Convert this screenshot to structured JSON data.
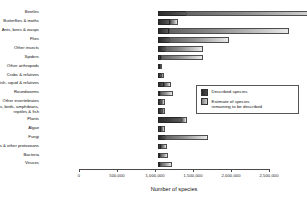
{
  "chart_data": {
    "type": "bar",
    "orientation": "horizontal",
    "stacked": true,
    "title": "",
    "xlabel": "Number of species",
    "ylabel": "",
    "xlim": [
      0,
      2500000
    ],
    "xticks": [
      0,
      500000,
      1000000,
      1500000,
      2000000,
      2500000
    ],
    "xtick_labels": [
      "0",
      "500,000",
      "1,000,000",
      "1,500,000",
      "2,000,000",
      "2,500,000"
    ],
    "grid": false,
    "legend_position": "center-right",
    "categories": [
      "Beetles",
      "Butterflies & moths",
      "Ants, bees & wasps",
      "Flies",
      "Other insects",
      "Spiders",
      "Other arthropods",
      "Crabs & relatives",
      "Shellfish, squid & relatives",
      "Roundworms",
      "Other invertebrates",
      "Mammals, birds, amphibians,\nreptiles & fish",
      "Plants",
      "Algae",
      "Fungi",
      "Amoebas & other protozoans",
      "Bacteria",
      "Viruses"
    ],
    "series": [
      {
        "name": "Described species",
        "color": "#333333",
        "values": [
          380000,
          160000,
          150000,
          155000,
          100000,
          45000,
          25000,
          47000,
          85000,
          25000,
          50000,
          65000,
          310000,
          45000,
          100000,
          40000,
          10000,
          5000
        ]
      },
      {
        "name": "Estimate of species remaining to be described",
        "color": "#b0b0b0",
        "values": [
          1920000,
          115000,
          1585000,
          790000,
          500000,
          550000,
          15000,
          38000,
          90000,
          180000,
          50000,
          30000,
          75000,
          55000,
          570000,
          80000,
          110000,
          165000
        ]
      }
    ],
    "totals": [
      2300000,
      275000,
      1735000,
      945000,
      600000,
      595000,
      40000,
      85000,
      175000,
      205000,
      100000,
      95000,
      385000,
      100000,
      670000,
      120000,
      120000,
      170000
    ]
  },
  "legend": {
    "items": [
      {
        "label": "Described species",
        "swatch": "swatch-described-icon"
      },
      {
        "label": "Estimate of species\nremaining to be described",
        "swatch": "swatch-remaining-icon"
      }
    ]
  }
}
